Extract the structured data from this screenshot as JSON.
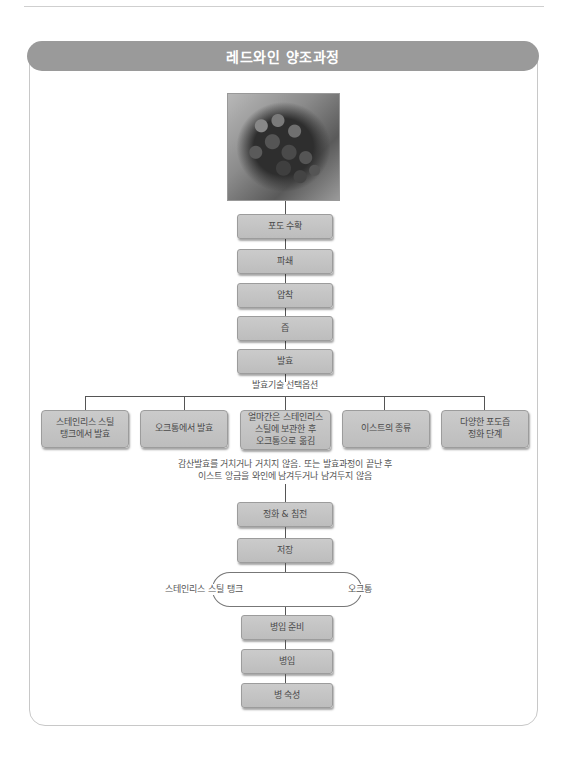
{
  "header": {
    "title": "레드와인 양조과정"
  },
  "image": {
    "icon": "grape-cluster-photo"
  },
  "steps_top": [
    {
      "label": "포도 수확"
    },
    {
      "label": "파쇄"
    },
    {
      "label": "압착"
    },
    {
      "label": "즙"
    },
    {
      "label": "발효"
    }
  ],
  "fermentation": {
    "options_title": "발효기술 선택옵션",
    "options": [
      {
        "label": "스테인리스 스틸\n탱크에서 발효"
      },
      {
        "label": "오크통에서 발효"
      },
      {
        "label": "얼마간은 스테인리스\n스틸에 보관한 후\n오크통으로 옮김"
      },
      {
        "label": "이스트의 종류"
      },
      {
        "label": "다양한 포도즙\n정화 단계"
      }
    ],
    "note": "감산발효를 거치거나 거치지 않음. 또는 발효과정이 끝난 후\n이스트 앙금을 와인에 남겨두거나 남겨두지 않음"
  },
  "steps_middle": [
    {
      "label": "정화 & 침전"
    },
    {
      "label": "저장"
    }
  ],
  "storage_split": {
    "left_label": "스테인리스 스틸 탱크",
    "right_label": "오크통"
  },
  "steps_bottom": [
    {
      "label": "병입 준비"
    },
    {
      "label": "병입"
    },
    {
      "label": "병 숙성"
    }
  ]
}
